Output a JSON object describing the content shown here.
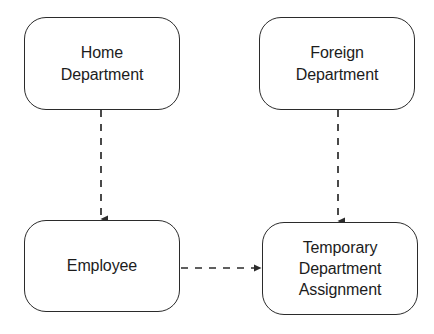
{
  "diagram": {
    "background_color": "#ffffff",
    "stroke_color": "#2b2b2b",
    "text_color": "#1c1c1c",
    "nodes": [
      {
        "id": "home-department",
        "label": "Home\nDepartment",
        "shape": "rounded-rectangle",
        "x": 24,
        "y": 17,
        "width": 156,
        "height": 93
      },
      {
        "id": "foreign-department",
        "label": "Foreign\nDepartment",
        "shape": "rounded-rectangle",
        "x": 259,
        "y": 17,
        "width": 156,
        "height": 93
      },
      {
        "id": "employee",
        "label": "Employee",
        "shape": "rounded-rectangle",
        "x": 24,
        "y": 220,
        "width": 156,
        "height": 92
      },
      {
        "id": "temporary-department-assignment",
        "label": "Temporary\nDepartment\nAssignment",
        "shape": "rounded-rectangle",
        "x": 262,
        "y": 222,
        "width": 156,
        "height": 93
      }
    ],
    "edges": [
      {
        "id": "home-department-to-employee",
        "from": "home-department",
        "to": "employee",
        "style": "dashed",
        "arrowhead": "filled-triangle",
        "direction": "down",
        "label": "",
        "x1": 101,
        "y1": 110,
        "x2": 101,
        "y2": 220
      },
      {
        "id": "foreign-department-to-temporary-department-assignment",
        "from": "foreign-department",
        "to": "temporary-department-assignment",
        "style": "dashed",
        "arrowhead": "filled-triangle",
        "direction": "down",
        "label": "",
        "x1": 338,
        "y1": 110,
        "x2": 338,
        "y2": 222
      },
      {
        "id": "employee-to-temporary-department-assignment",
        "from": "employee",
        "to": "temporary-department-assignment",
        "style": "dashed",
        "arrowhead": "filled-triangle",
        "direction": "right",
        "label": "",
        "x1": 180,
        "y1": 268,
        "x2": 262,
        "y2": 268
      }
    ]
  }
}
